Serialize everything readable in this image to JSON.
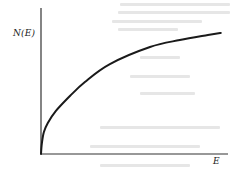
{
  "chart_data": {
    "type": "line",
    "title": "",
    "xlabel": "E",
    "ylabel": "N(E)",
    "grid": false,
    "legend": null,
    "axes": {
      "origin_px": [
        41,
        154
      ],
      "x_end_px": [
        228,
        154
      ],
      "y_end_px": [
        41,
        8
      ],
      "ticks": "none"
    },
    "series": [
      {
        "name": "N(E)",
        "description": "Monotonically increasing concave curve starting at origin, steep near E=0 and flattening at large E (sqrt/log-like density of states)",
        "x": [
          0.0,
          0.005,
          0.016,
          0.038,
          0.083,
          0.161,
          0.244,
          0.383,
          0.606,
          0.772,
          0.928,
          1.0
        ],
        "y": [
          0.0,
          0.075,
          0.151,
          0.212,
          0.295,
          0.397,
          0.493,
          0.616,
          0.733,
          0.781,
          0.815,
          0.829
        ],
        "color": "#1a1a1a"
      }
    ],
    "xlim": [
      0,
      1.04
    ],
    "ylim": [
      0,
      1.0
    ]
  },
  "labels": {
    "y_axis": "N(E)",
    "x_axis": "E"
  },
  "colors": {
    "line": "#1a1a1a",
    "axes": "#333333",
    "background": "#ffffff"
  }
}
